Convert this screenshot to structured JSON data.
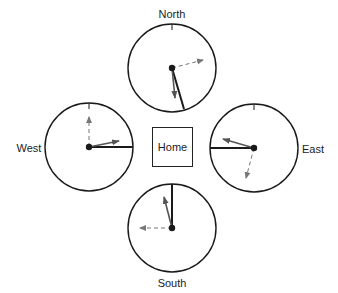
{
  "diagram": {
    "home": {
      "label": "Home",
      "x": 152,
      "y": 127,
      "w": 41,
      "h": 40
    },
    "colors": {
      "stroke": "#1a1a1a",
      "gray_arrow": "#555555",
      "dashed_arrow": "#777777"
    },
    "clocks": [
      {
        "name": "North",
        "cx": 172,
        "cy": 68,
        "r": 44,
        "label": {
          "text": "North",
          "x": 172,
          "y": 14
        },
        "tick": true,
        "black_hand": [
          184,
          109
        ],
        "gray_arrow": [
          175,
          98
        ],
        "dashed_arrow": [
          203,
          60
        ]
      },
      {
        "name": "West",
        "cx": 89,
        "cy": 147,
        "r": 44,
        "label": {
          "text": "West",
          "x": 29,
          "y": 148
        },
        "tick": true,
        "black_hand": [
          133,
          147
        ],
        "gray_arrow": [
          119,
          141
        ],
        "dashed_arrow": [
          89,
          117
        ]
      },
      {
        "name": "East",
        "cx": 254,
        "cy": 148,
        "r": 44,
        "label": {
          "text": "East",
          "x": 313,
          "y": 149
        },
        "tick": true,
        "black_hand": [
          210,
          148
        ],
        "gray_arrow": [
          223,
          139
        ],
        "dashed_arrow": [
          246,
          178
        ]
      },
      {
        "name": "South",
        "cx": 172,
        "cy": 228,
        "r": 44,
        "label": {
          "text": "South",
          "x": 172,
          "y": 283
        },
        "tick": false,
        "black_hand": [
          172,
          184
        ],
        "gray_arrow": [
          164,
          197
        ],
        "dashed_arrow": [
          140,
          228
        ]
      }
    ]
  }
}
